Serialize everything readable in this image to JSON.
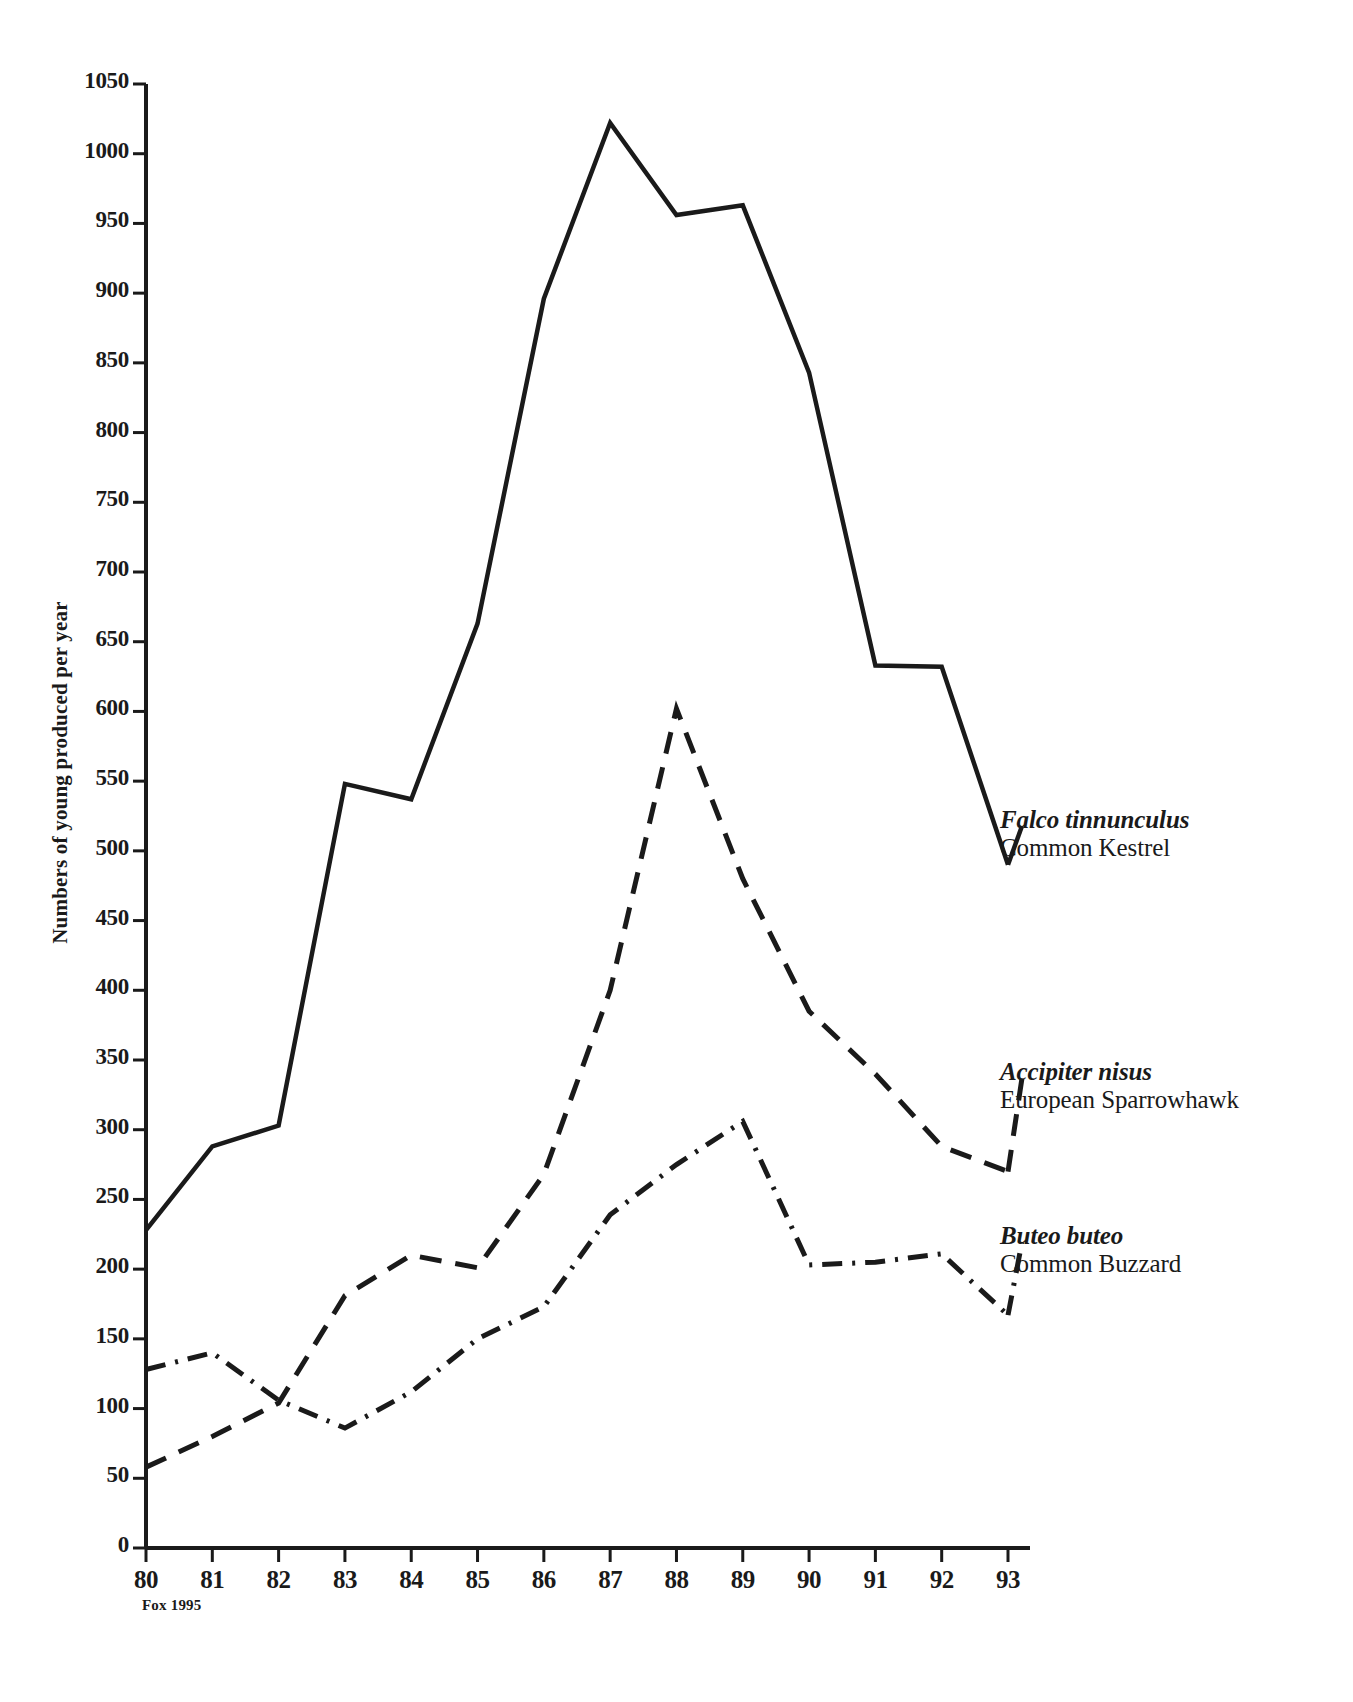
{
  "figure": {
    "source_note": "Fox 1995",
    "ylabel": "Numbers of young produced per year"
  },
  "chart_data": {
    "type": "line",
    "title": "",
    "xlabel": "",
    "ylabel": "Numbers of young produced per year",
    "categories": [
      "80",
      "81",
      "82",
      "83",
      "84",
      "85",
      "86",
      "87",
      "88",
      "89",
      "90",
      "91",
      "92",
      "93"
    ],
    "x": [
      80,
      81,
      82,
      83,
      84,
      85,
      86,
      87,
      88,
      89,
      90,
      91,
      92,
      93
    ],
    "xlim": [
      80,
      93
    ],
    "ylim": [
      0,
      1050
    ],
    "yticks": [
      0,
      50,
      100,
      150,
      200,
      250,
      300,
      350,
      400,
      450,
      500,
      550,
      600,
      650,
      700,
      750,
      800,
      850,
      900,
      950,
      1000,
      1050
    ],
    "ytick_labels": [
      "0",
      "50",
      "100",
      "150",
      "200",
      "250",
      "300",
      "350",
      "400",
      "450",
      "500",
      "550",
      "600",
      "650",
      "700",
      "750",
      "800",
      "850",
      "900",
      "950",
      "1000",
      "1050"
    ],
    "grid": false,
    "legend_position": "right-of-plot-line-ends",
    "series": [
      {
        "name": "Falco tinnunculus",
        "common_name": "Common Kestrel",
        "style": "solid",
        "color": "#1a1a1a",
        "values": [
          228,
          288,
          303,
          548,
          537,
          663,
          896,
          1022,
          956,
          963,
          843,
          633,
          632,
          490
        ]
      },
      {
        "name": "Accipiter nisus",
        "common_name": "European Sparrowhawk",
        "style": "dashed",
        "color": "#1a1a1a",
        "values": [
          58,
          80,
          104,
          181,
          210,
          201,
          268,
          400,
          602,
          480,
          385,
          340,
          288,
          270
        ]
      },
      {
        "name": "Buteo buteo",
        "common_name": "Common Buzzard",
        "style": "dashdot",
        "color": "#1a1a1a",
        "values": [
          128,
          140,
          106,
          86,
          112,
          150,
          173,
          239,
          275,
          306,
          203,
          205,
          211,
          167
        ]
      }
    ],
    "annotations": [
      "Fox 1995"
    ]
  },
  "legend": [
    {
      "sci": "Falco tinnunculus",
      "com": "Common Kestrel"
    },
    {
      "sci": "Accipiter nisus",
      "com": "European Sparrowhawk"
    },
    {
      "sci": "Buteo buteo",
      "com": "Common Buzzard"
    }
  ]
}
